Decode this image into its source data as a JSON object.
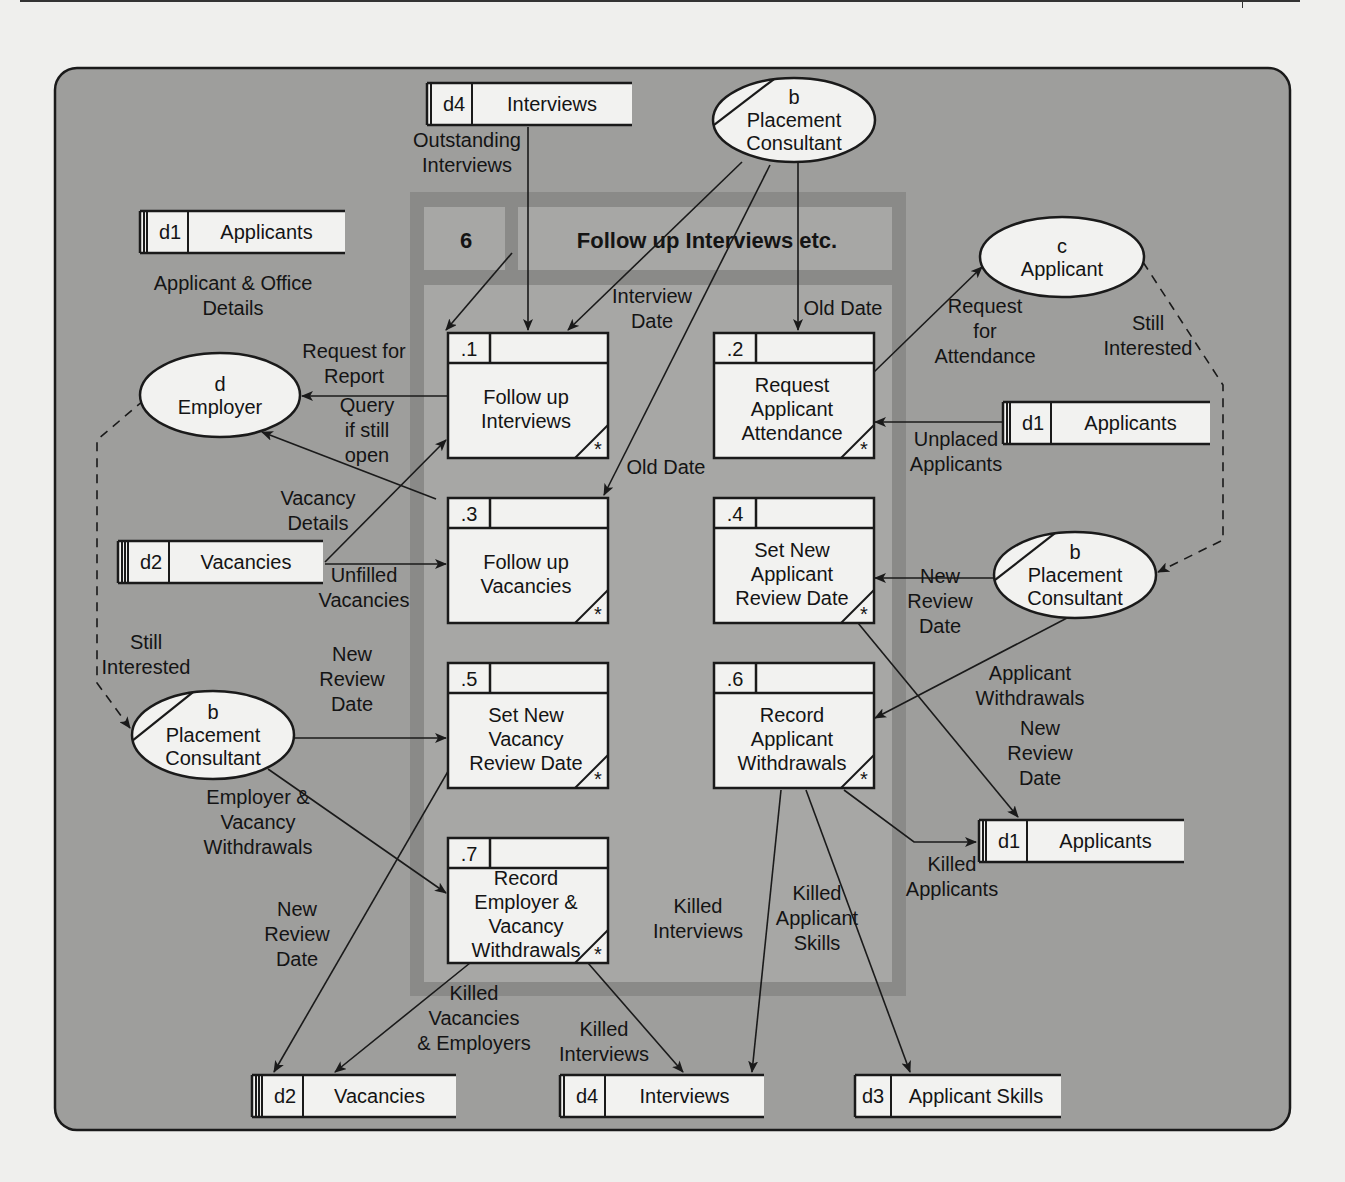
{
  "diagram": {
    "type": "data-flow-diagram",
    "colors": {
      "canvas": "#9e9e9c",
      "frame": "#8a8a88",
      "frame_panel": "#a7a7a5",
      "box_fill": "#f2f2f0",
      "ink": "#1a1a1a",
      "page": "#efefed"
    },
    "process_group": {
      "id": "6",
      "title": "Follow up Interviews etc."
    },
    "processes": [
      {
        "id": ".1",
        "label": [
          "Follow up",
          "Interviews"
        ],
        "x": 448,
        "y": 333
      },
      {
        "id": ".2",
        "label": [
          "Request",
          "Applicant",
          "Attendance"
        ],
        "x": 714,
        "y": 333
      },
      {
        "id": ".3",
        "label": [
          "Follow up",
          "Vacancies"
        ],
        "x": 448,
        "y": 498
      },
      {
        "id": ".4",
        "label": [
          "Set New",
          "Applicant",
          "Review Date"
        ],
        "x": 714,
        "y": 498
      },
      {
        "id": ".5",
        "label": [
          "Set New",
          "Vacancy",
          "Review Date"
        ],
        "x": 448,
        "y": 663
      },
      {
        "id": ".6",
        "label": [
          "Record",
          "Applicant",
          "Withdrawals"
        ],
        "x": 714,
        "y": 663
      },
      {
        "id": ".7",
        "label": [
          "Record",
          "Employer &",
          "Vacancy",
          "Withdrawals"
        ],
        "x": 448,
        "y": 838
      }
    ],
    "data_stores": [
      {
        "id": "d4",
        "name": "Interviews",
        "x": 427,
        "y": 83,
        "w": 205,
        "bars": 1
      },
      {
        "id": "d1",
        "name": "Applicants",
        "x": 140,
        "y": 211,
        "w": 205,
        "bars": 2
      },
      {
        "id": "d1",
        "name": "Applicants",
        "x": 1003,
        "y": 402,
        "w": 207,
        "bars": 2
      },
      {
        "id": "d2",
        "name": "Vacancies",
        "x": 118,
        "y": 541,
        "w": 205,
        "bars": 3
      },
      {
        "id": "d1",
        "name": "Applicants",
        "x": 979,
        "y": 820,
        "w": 205,
        "bars": 2
      },
      {
        "id": "d2",
        "name": "Vacancies",
        "x": 252,
        "y": 1075,
        "w": 204,
        "bars": 3
      },
      {
        "id": "d4",
        "name": "Interviews",
        "x": 560,
        "y": 1075,
        "w": 204,
        "bars": 1
      },
      {
        "id": "d3",
        "name": "Applicant Skills",
        "x": 855,
        "y": 1075,
        "w": 206,
        "bars": 0
      }
    ],
    "external_entities": [
      {
        "id": "b",
        "name": [
          "Placement",
          "Consultant"
        ],
        "cx": 794,
        "cy": 120,
        "rx": 81,
        "ry": 42,
        "duplicate": true
      },
      {
        "id": "c",
        "name": [
          "Applicant"
        ],
        "cx": 1062,
        "cy": 257,
        "rx": 82,
        "ry": 40,
        "duplicate": false
      },
      {
        "id": "d",
        "name": [
          "Employer"
        ],
        "cx": 220,
        "cy": 395,
        "rx": 80,
        "ry": 42,
        "duplicate": false
      },
      {
        "id": "b",
        "name": [
          "Placement",
          "Consultant"
        ],
        "cx": 1075,
        "cy": 575,
        "rx": 81,
        "ry": 43,
        "duplicate": true
      },
      {
        "id": "b",
        "name": [
          "Placement",
          "Consultant"
        ],
        "cx": 213,
        "cy": 735,
        "rx": 81,
        "ry": 44,
        "duplicate": true
      }
    ],
    "flow_labels": [
      {
        "text": [
          "Outstanding",
          "Interviews"
        ],
        "x": 467,
        "y": 152
      },
      {
        "text": [
          "Applicant & Office",
          "Details"
        ],
        "x": 233,
        "y": 295
      },
      {
        "text": [
          "Interview",
          "Date"
        ],
        "x": 652,
        "y": 308
      },
      {
        "text": [
          "Old Date"
        ],
        "x": 843,
        "y": 308
      },
      {
        "text": [
          "Request",
          "for",
          "Attendance"
        ],
        "x": 985,
        "y": 331
      },
      {
        "text": [
          "Still",
          "Interested"
        ],
        "x": 1148,
        "y": 335
      },
      {
        "text": [
          "Request for",
          "Report"
        ],
        "x": 354,
        "y": 363
      },
      {
        "text": [
          "Query",
          "if still",
          "open"
        ],
        "x": 367,
        "y": 430
      },
      {
        "text": [
          "Old Date"
        ],
        "x": 666,
        "y": 467
      },
      {
        "text": [
          "Unplaced",
          "Applicants"
        ],
        "x": 956,
        "y": 451
      },
      {
        "text": [
          "Vacancy",
          "Details"
        ],
        "x": 318,
        "y": 510
      },
      {
        "text": [
          "Unfilled",
          "Vacancies"
        ],
        "x": 364,
        "y": 587
      },
      {
        "text": [
          "New",
          "Review",
          "Date"
        ],
        "x": 940,
        "y": 601
      },
      {
        "text": [
          "Still",
          "Interested"
        ],
        "x": 146,
        "y": 654
      },
      {
        "text": [
          "New",
          "Review",
          "Date"
        ],
        "x": 352,
        "y": 679
      },
      {
        "text": [
          "Applicant",
          "Withdrawals"
        ],
        "x": 1030,
        "y": 685
      },
      {
        "text": [
          "New",
          "Review",
          "Date"
        ],
        "x": 1040,
        "y": 753
      },
      {
        "text": [
          "Employer &",
          "Vacancy",
          "Withdrawals"
        ],
        "x": 258,
        "y": 822
      },
      {
        "text": [
          "Killed",
          "Applicants"
        ],
        "x": 952,
        "y": 876
      },
      {
        "text": [
          "Killed",
          "Interviews"
        ],
        "x": 698,
        "y": 918
      },
      {
        "text": [
          "Killed",
          "Applicant",
          "Skills"
        ],
        "x": 817,
        "y": 918
      },
      {
        "text": [
          "New",
          "Review",
          "Date"
        ],
        "x": 297,
        "y": 934
      },
      {
        "text": [
          "Killed",
          "Vacancies",
          "& Employers"
        ],
        "x": 474,
        "y": 1018
      },
      {
        "text": [
          "Killed",
          "Interviews"
        ],
        "x": 604,
        "y": 1041
      }
    ],
    "flows": [
      {
        "d": "M528,127 L528,330",
        "arrow": "end"
      },
      {
        "d": "M512,253 L446,330",
        "arrow": "end"
      },
      {
        "d": "M742,162 L568,330",
        "arrow": "end"
      },
      {
        "d": "M798,162 L798,330",
        "arrow": "end"
      },
      {
        "d": "M770,165 L604,495",
        "arrow": "end"
      },
      {
        "d": "M874,372 L982,267",
        "arrow": "end"
      },
      {
        "d": "M1003,422 L875,422",
        "arrow": "end"
      },
      {
        "d": "M448,396 L302,396",
        "arrow": "end"
      },
      {
        "d": "M436,499 L262,432",
        "arrow": "end"
      },
      {
        "d": "M325,562 L446,440",
        "arrow": "end"
      },
      {
        "d": "M325,564 L446,564",
        "arrow": "end"
      },
      {
        "d": "M994,578 L875,578",
        "arrow": "end"
      },
      {
        "d": "M1067,618 L875,718",
        "arrow": "end"
      },
      {
        "d": "M858,623 L1018,817",
        "arrow": "end"
      },
      {
        "d": "M844,790 L914,842 L976,842",
        "arrow": "end"
      },
      {
        "d": "M781,790 L752,1072",
        "arrow": "end"
      },
      {
        "d": "M806,790 L910,1072",
        "arrow": "end"
      },
      {
        "d": "M294,738 L446,738",
        "arrow": "end"
      },
      {
        "d": "M268,769 L446,893",
        "arrow": "end"
      },
      {
        "d": "M465,742 L274,1072",
        "arrow": "end"
      },
      {
        "d": "M470,963 L335,1072",
        "arrow": "end"
      },
      {
        "d": "M588,963 L683,1072",
        "arrow": "end"
      }
    ],
    "dashed_flows": [
      {
        "d": "M1143,262 L1223,385 L1223,540 L1158,572",
        "arrow": "end"
      },
      {
        "d": "M144,400 L97,440 L97,683 L130,728",
        "arrow": "end"
      }
    ]
  }
}
